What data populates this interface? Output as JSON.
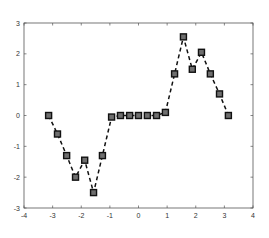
{
  "chart_data": {
    "type": "line",
    "title": "",
    "xlabel": "",
    "ylabel": "",
    "xlim": [
      -4,
      4
    ],
    "ylim": [
      -3,
      3
    ],
    "grid": false,
    "legend": null,
    "x_ticks": [
      -4,
      -3,
      -2,
      -1,
      0,
      1,
      2,
      3,
      4
    ],
    "y_ticks": [
      -3,
      -2,
      -1,
      0,
      1,
      2,
      3
    ],
    "series": [
      {
        "name": "data",
        "line_style": "dashed",
        "marker": "square",
        "color": "#111111",
        "marker_fill": "#6e6e6e",
        "x": [
          -3.14,
          -2.83,
          -2.51,
          -2.2,
          -1.88,
          -1.57,
          -1.26,
          -0.94,
          -0.63,
          -0.31,
          0.0,
          0.31,
          0.63,
          0.94,
          1.26,
          1.57,
          1.88,
          2.2,
          2.51,
          2.83,
          3.14
        ],
        "y": [
          0.0,
          -0.6,
          -1.3,
          -2.0,
          -1.45,
          -2.5,
          -1.3,
          -0.05,
          0.0,
          0.0,
          0.0,
          0.0,
          0.0,
          0.1,
          1.35,
          2.55,
          1.5,
          2.05,
          1.35,
          0.7,
          0.0
        ]
      }
    ]
  },
  "colors": {
    "axes": "#555555",
    "line": "#111111",
    "marker_edge": "#111111",
    "marker_fill": "#6e6e6e",
    "background": "#ffffff"
  }
}
